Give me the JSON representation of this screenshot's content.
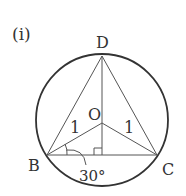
{
  "figure": {
    "label": "(i)",
    "points": {
      "D": "D",
      "O": "O",
      "B": "B",
      "C": "C"
    },
    "lengths": {
      "OB": "1",
      "OC": "1"
    },
    "angle": "30°",
    "right_angle_marker": true,
    "colors": {
      "stroke": "#333333",
      "background": "#ffffff"
    }
  }
}
